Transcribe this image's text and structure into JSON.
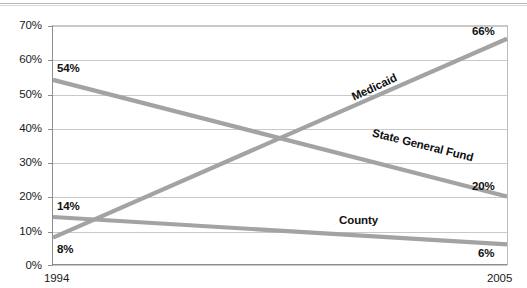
{
  "chart_data": {
    "type": "line",
    "title": "",
    "subtitle": "",
    "xlabel": "",
    "ylabel": "",
    "x": [
      "1994",
      "2005"
    ],
    "xtick_labels": [
      "1994",
      "2005"
    ],
    "ytick_labels": [
      "0%",
      "10%",
      "20%",
      "30%",
      "40%",
      "50%",
      "60%",
      "70%"
    ],
    "ytick_values": [
      0,
      10,
      20,
      30,
      40,
      50,
      60,
      70
    ],
    "ylim": [
      0,
      70
    ],
    "grid": "horizontal",
    "legend_position": "inline-on-series",
    "series": [
      {
        "name": "Medicaid",
        "values": [
          8,
          66
        ],
        "start_label": "8%",
        "end_label": "66%",
        "color": "#a3a3a3"
      },
      {
        "name": "State General Fund",
        "values": [
          54,
          20
        ],
        "start_label": "54%",
        "end_label": "20%",
        "color": "#a3a3a3"
      },
      {
        "name": "County",
        "values": [
          14,
          6
        ],
        "start_label": "14%",
        "end_label": "6%",
        "color": "#a3a3a3"
      }
    ],
    "annotations": [
      {
        "text": "Medicaid",
        "rotation": -25
      },
      {
        "text": "State General Fund",
        "rotation": 14
      },
      {
        "text": "County",
        "rotation": 0
      }
    ],
    "colors": {
      "line": "#a3a3a3",
      "grid": "#c9c9c9",
      "axis": "#8d8d8d",
      "text": "#111111",
      "background": "#ffffff"
    }
  }
}
